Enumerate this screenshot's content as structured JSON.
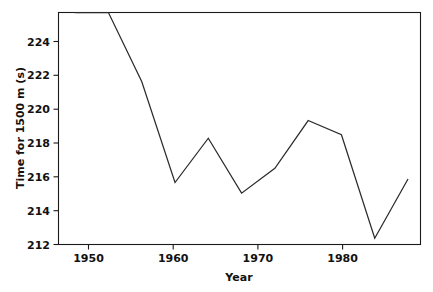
{
  "chart_data": {
    "type": "line",
    "title": "",
    "xlabel": "Year",
    "ylabel": "Time for 1500 m (s)",
    "xlim": [
      1946,
      1989.5
    ],
    "ylim": [
      212,
      225.1
    ],
    "grid": false,
    "legend": "none",
    "x_ticks": [
      1950,
      1960,
      1970,
      1980
    ],
    "x_tick_labels": [
      "1950",
      "1960",
      "1970",
      "1980"
    ],
    "y_ticks": [
      212,
      214,
      216,
      218,
      220,
      222,
      224
    ],
    "y_tick_labels": [
      "212",
      "214",
      "216",
      "218",
      "220",
      "222",
      "224"
    ],
    "series": [
      {
        "name": "Olympic 1500 m winning time",
        "color": "#2b2b2b",
        "x": [
          1948,
          1952,
          1956,
          1960,
          1964,
          1968,
          1972,
          1976,
          1980,
          1984,
          1988
        ],
        "values": [
          225.2,
          225.1,
          221.2,
          215.5,
          218.0,
          214.9,
          216.3,
          219.0,
          218.2,
          212.35,
          215.7
        ]
      }
    ]
  },
  "axes": {
    "y_axis_label": "Time for 1500 m (s)",
    "x_axis_label": "Year"
  }
}
